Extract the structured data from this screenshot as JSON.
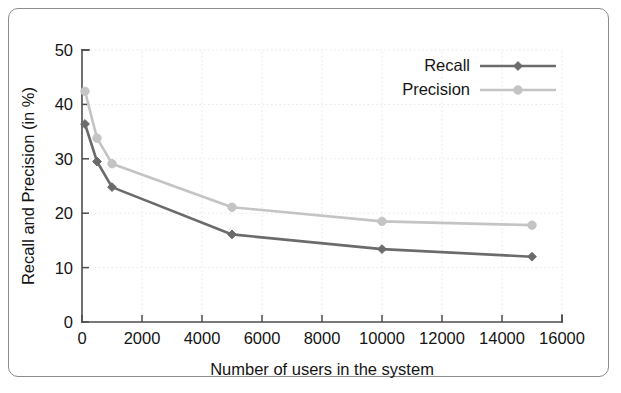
{
  "figure": {
    "has_border_frame": true,
    "background_color": "#ffffff"
  },
  "chart_data": {
    "type": "line",
    "title": "",
    "xlabel": "Number of users in the system",
    "ylabel": "Recall and Precision (in %)",
    "xlim": [
      0,
      16000
    ],
    "ylim": [
      0,
      50
    ],
    "xticks": [
      0,
      2000,
      4000,
      6000,
      8000,
      10000,
      12000,
      14000,
      16000
    ],
    "xtick_labels": [
      "0",
      "2000",
      "4000",
      "6000",
      "8000",
      "10000",
      "12000",
      "14000",
      "16000"
    ],
    "yticks": [
      0,
      10,
      20,
      30,
      40,
      50
    ],
    "ytick_labels": [
      "0",
      "10",
      "20",
      "30",
      "40",
      "50"
    ],
    "grid": true,
    "legend_position": "top-right",
    "x": [
      100,
      500,
      1000,
      5000,
      10000,
      15000
    ],
    "series": [
      {
        "name": "Recall",
        "color": "#6b6b6b",
        "marker": "diamond",
        "values": [
          36.4,
          29.5,
          24.8,
          16.1,
          13.4,
          12.0
        ]
      },
      {
        "name": "Precision",
        "color": "#c4c4c4",
        "marker": "circle",
        "values": [
          42.4,
          33.8,
          29.1,
          21.1,
          18.5,
          17.8
        ]
      }
    ]
  },
  "legend": {
    "entries": [
      {
        "label": "Recall"
      },
      {
        "label": "Precision"
      }
    ]
  },
  "colors": {
    "axis": "#4d4d4d",
    "text": "#151515",
    "grid": "#e2e2e2",
    "recall": "#6b6b6b",
    "precision": "#c4c4c4",
    "frame": "#8c8c8c"
  }
}
